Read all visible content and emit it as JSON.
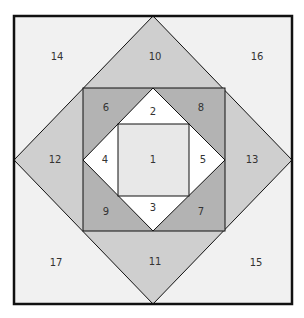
{
  "diagram": {
    "colors": {
      "outer_triangles": "#f1f1f1",
      "diamond_triangles": "#cfcfcf",
      "corner_triangles": "#b3b3b3",
      "inner_triangles": "#ffffff",
      "center_square": "#e8e8e8",
      "stroke": "#111111"
    },
    "pieces": [
      {
        "id": "1",
        "label": "1",
        "shape": "center-square"
      },
      {
        "id": "2",
        "label": "2",
        "shape": "inner-triangle-top"
      },
      {
        "id": "3",
        "label": "3",
        "shape": "inner-triangle-bottom"
      },
      {
        "id": "4",
        "label": "4",
        "shape": "inner-triangle-left"
      },
      {
        "id": "5",
        "label": "5",
        "shape": "inner-triangle-right"
      },
      {
        "id": "6",
        "label": "6",
        "shape": "corner-triangle-top-left"
      },
      {
        "id": "7",
        "label": "7",
        "shape": "corner-triangle-bottom-right"
      },
      {
        "id": "8",
        "label": "8",
        "shape": "corner-triangle-top-right"
      },
      {
        "id": "9",
        "label": "9",
        "shape": "corner-triangle-bottom-left"
      },
      {
        "id": "10",
        "label": "10",
        "shape": "diamond-triangle-top"
      },
      {
        "id": "11",
        "label": "11",
        "shape": "diamond-triangle-bottom"
      },
      {
        "id": "12",
        "label": "12",
        "shape": "diamond-triangle-left"
      },
      {
        "id": "13",
        "label": "13",
        "shape": "diamond-triangle-right"
      },
      {
        "id": "14",
        "label": "14",
        "shape": "outer-triangle-top-left"
      },
      {
        "id": "15",
        "label": "15",
        "shape": "outer-triangle-bottom-right"
      },
      {
        "id": "16",
        "label": "16",
        "shape": "outer-triangle-top-right"
      },
      {
        "id": "17",
        "label": "17",
        "shape": "outer-triangle-bottom-left"
      }
    ]
  }
}
